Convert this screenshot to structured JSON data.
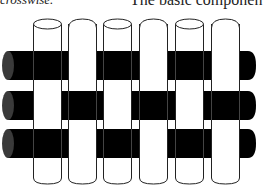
{
  "text": {
    "left_fragment": "crosswise.",
    "right_fragment": "The basic componen"
  },
  "diagram": {
    "colors": {
      "warp_fill": "#ffffff",
      "warp_stroke": "#222222",
      "weft_fill": "#000000",
      "weft_endcap": "#3a3a3a",
      "background": "#ffffff"
    },
    "warp_count": 6,
    "weft_count": 3,
    "weft_rows": [
      {
        "row": 1,
        "over_warps": [
          1,
          3,
          5
        ],
        "under_warps": [
          2,
          4,
          6
        ]
      },
      {
        "row": 2,
        "over_warps": [
          2,
          4,
          6
        ],
        "under_warps": [
          1,
          3,
          5
        ]
      },
      {
        "row": 3,
        "over_warps": [
          1,
          3,
          5
        ],
        "under_warps": [
          2,
          4,
          6
        ]
      }
    ]
  }
}
